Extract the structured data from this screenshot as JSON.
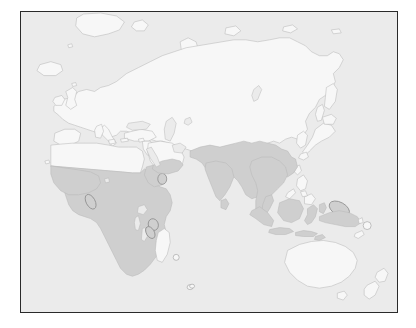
{
  "figure": {
    "type": "distribution-map",
    "title": "",
    "projection_extent": "Eastern Hemisphere world map",
    "frame_color": "#2a2a2a",
    "background_color": "#ffffff"
  },
  "legend": {
    "visible": false,
    "entries": [
      {
        "label": "Distribution range",
        "color": "#cfcfcf"
      },
      {
        "label": "Land outside range",
        "color": "#f7f7f7"
      },
      {
        "label": "Ocean",
        "color": "#ebebeb"
      }
    ]
  },
  "colors": {
    "ocean": "#ebebeb",
    "land": "#f7f7f7",
    "range_fill": "#cfcfcf",
    "coastline": "#b9b9b9",
    "frame": "#2a2a2a"
  },
  "regions_shaded": [
    "Sub-Saharan Africa",
    "Sahel",
    "Horn of Africa",
    "Southern Africa",
    "Comoros",
    "Socotra",
    "Southern Arabian Peninsula (Yemen, Oman)",
    "Indian subcontinent",
    "Sri Lanka",
    "Myanmar",
    "Thailand",
    "Indochina",
    "Malay Peninsula",
    "Sumatra",
    "Java",
    "Borneo",
    "Sulawesi",
    "Lesser Sunda Islands",
    "New Guinea",
    "Solomon Islands"
  ],
  "regions_unshaded": [
    "Europe",
    "North Africa / Sahara",
    "Greenland",
    "Iceland",
    "Russia / Siberia",
    "Central Asia",
    "China",
    "Mongolia",
    "Korea",
    "Japan",
    "Philippines",
    "Madagascar",
    "Australia",
    "Tasmania",
    "New Zealand"
  ],
  "map_labels": [],
  "axis": {
    "visible": false,
    "ticks": []
  },
  "annotations": []
}
